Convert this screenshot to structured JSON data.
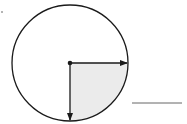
{
  "diagram": {
    "type": "circle-fraction",
    "circle": {
      "cx": 70,
      "cy": 63,
      "r": 58
    },
    "shaded_fraction": "1/4",
    "shaded_quadrant": "bottom-right",
    "colors": {
      "stroke": "#1a1a1a",
      "shade": "#ebebeb",
      "background": "#ffffff"
    },
    "arrows": [
      {
        "name": "right-arrow",
        "to": [
          128,
          63
        ]
      },
      {
        "name": "down-arrow",
        "to": [
          70,
          120
        ]
      }
    ],
    "answer_line": {
      "x1": 132,
      "x2": 182,
      "y": 103,
      "value": ""
    }
  }
}
